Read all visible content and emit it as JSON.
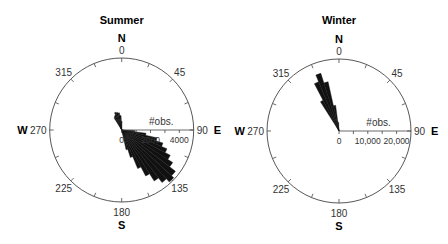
{
  "chart_data": [
    {
      "type": "polar-bar",
      "title": "Summer",
      "center": [
        121.7,
        130
      ],
      "radius": 72,
      "rmax": 5000,
      "radial_axis": {
        "label": "#obs.",
        "ticks": [
          0,
          1000,
          2000,
          3000,
          4000
        ],
        "tick_labels": [
          "0",
          "2000",
          "4000"
        ],
        "tick_label_values": [
          0,
          2000,
          4000
        ]
      },
      "angle_ticks": [
        "0",
        "45",
        "90",
        "135",
        "180",
        "225",
        "270",
        "315"
      ],
      "cardinals": {
        "N": "N",
        "E": "E",
        "S": "S",
        "W": "W"
      },
      "bin_width_deg": 5,
      "bins_deg": [
        330,
        335,
        340,
        345,
        350,
        355,
        0,
        95,
        100,
        105,
        110,
        115,
        120,
        125,
        130,
        135,
        140,
        145,
        150,
        155,
        160,
        165
      ],
      "values": [
        1000,
        1100,
        1300,
        1250,
        1200,
        1000,
        600,
        900,
        1700,
        2500,
        3000,
        3400,
        3800,
        4200,
        4700,
        4900,
        4600,
        4200,
        3600,
        2900,
        2000,
        1400
      ]
    },
    {
      "type": "polar-bar",
      "title": "Winter",
      "center": [
        339,
        131
      ],
      "radius": 72,
      "rmax": 25000,
      "radial_axis": {
        "label": "#obs.",
        "ticks": [
          0,
          5000,
          10000,
          15000,
          20000
        ],
        "tick_labels": [
          "0",
          "10,000",
          "20,000"
        ],
        "tick_label_values": [
          0,
          10000,
          20000
        ]
      },
      "angle_ticks": [
        "0",
        "45",
        "90",
        "135",
        "180",
        "225",
        "270",
        "315"
      ],
      "cardinals": {
        "N": "N",
        "E": "E",
        "S": "S",
        "W": "W"
      },
      "bin_width_deg": 5,
      "bins_deg": [
        330,
        335,
        340,
        345,
        350,
        355
      ],
      "values": [
        12000,
        18500,
        21000,
        17500,
        9000,
        3000
      ]
    }
  ]
}
